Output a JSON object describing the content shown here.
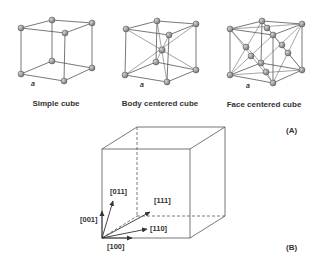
{
  "panel_a": {
    "label": "(A)",
    "lattice_parameter_label": "a",
    "cells": [
      {
        "name": "simple-cube",
        "caption": "Simple cube"
      },
      {
        "name": "body-centered-cube",
        "caption": "Body centered cube"
      },
      {
        "name": "face-centered-cube",
        "caption": "Face centered cube"
      }
    ]
  },
  "panel_b": {
    "label": "(B)",
    "directions": {
      "d001": "[001]",
      "d011": "[011]",
      "d111": "[111]",
      "d110": "[110]",
      "d100": "[100]"
    }
  },
  "colors": {
    "line": "#555555",
    "atom_light": "#bdbdbd",
    "atom_dark": "#6e6e6e",
    "text": "#333333"
  }
}
